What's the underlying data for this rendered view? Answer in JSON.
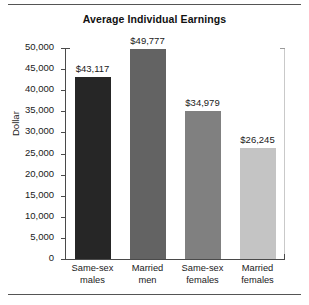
{
  "chart_data": {
    "type": "bar",
    "title": "Average Individual Earnings",
    "xlabel": "",
    "ylabel": "Dollar",
    "ylim": [
      0,
      50000
    ],
    "grid": false,
    "legend": "none",
    "categories": [
      "Same-sex males",
      "Married men",
      "Same-sex females",
      "Married females"
    ],
    "category_lines": [
      [
        "Same-sex",
        "males"
      ],
      [
        "Married",
        "men"
      ],
      [
        "Same-sex",
        "females"
      ],
      [
        "Married",
        "females"
      ]
    ],
    "values": [
      43117,
      49777,
      34979,
      26245
    ],
    "value_labels": [
      "$43,117",
      "$49,777",
      "$34,979",
      "$26,245"
    ],
    "bar_colors": [
      "#262626",
      "#636363",
      "#808080",
      "#c4c4c4"
    ],
    "ytick_values": [
      0,
      5000,
      10000,
      15000,
      20000,
      25000,
      30000,
      35000,
      40000,
      45000,
      50000
    ],
    "ytick_labels": [
      "0",
      "5,000",
      "10,000",
      "15,000",
      "20,000",
      "25,000",
      "30,000",
      "35,000",
      "40,000",
      "45,000",
      "50,000"
    ]
  },
  "figure": {
    "axis_color": "#4a4a4a",
    "text_color": "#1a1a1a",
    "rule_color": "#555555",
    "background": "#ffffff"
  }
}
